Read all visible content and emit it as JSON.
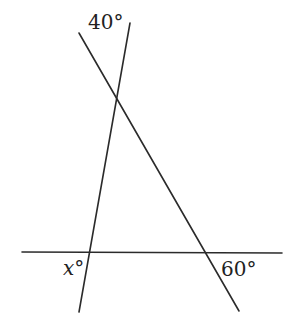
{
  "diagram": {
    "labels": {
      "top_angle": "40°",
      "bottom_left_angle": "x°",
      "bottom_right_angle": "60°"
    },
    "lines": [
      {
        "name": "horizontal-line",
        "x1": 22,
        "y1": 252,
        "x2": 282,
        "y2": 253
      },
      {
        "name": "steep-line",
        "x1": 130,
        "y1": 23,
        "x2": 79,
        "y2": 312
      },
      {
        "name": "diagonal-line",
        "x1": 79,
        "y1": 33,
        "x2": 239,
        "y2": 311
      }
    ],
    "colors": {
      "line": "#2b2b2b",
      "text": "#222222",
      "background": "#ffffff"
    }
  }
}
